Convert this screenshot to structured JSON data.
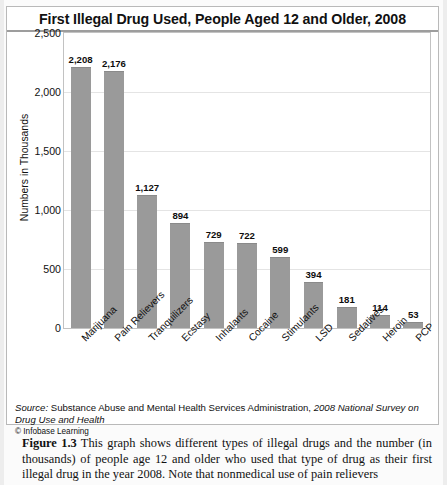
{
  "card": {
    "title": "First Illegal Drug Used, People Aged 12 and Older, 2008"
  },
  "source": {
    "prefix": "Source:",
    "text": " Substance Abuse and Mental Health Services Administration, ",
    "italic_title": "2008 National Survey on Drug Use and Health",
    "copyright": "© Infobase Learning"
  },
  "caption": {
    "figure_label": "Figure 1.3",
    "body": "   This graph shows different types of illegal drugs and the number (in thousands) of people age 12 and older who used that type of drug as their first illegal drug in the year 2008. Note that nonmedical use of pain relievers"
  },
  "chart_data": {
    "type": "bar",
    "title": "First Illegal Drug Used, People Aged 12 and Older, 2008",
    "xlabel": "",
    "ylabel": "Numbers in Thousands",
    "ylim": [
      0,
      2500
    ],
    "yticks": [
      0,
      500,
      1000,
      1500,
      2000,
      2500
    ],
    "ytick_labels": [
      "0",
      "500",
      "1,000",
      "1,500",
      "2,000",
      "2,500"
    ],
    "grid": true,
    "legend": false,
    "bar_color": "#9a9a9a",
    "categories": [
      "Marijuana",
      "Pain Relievers",
      "Tranquilizers",
      "Ecstasy",
      "Inhalants",
      "Cocaine",
      "Stimulants",
      "LSD",
      "Sedatives",
      "Heroin",
      "PCP"
    ],
    "values": [
      2208,
      2176,
      1127,
      894,
      729,
      722,
      599,
      394,
      181,
      114,
      53
    ],
    "value_labels": [
      "2,208",
      "2,176",
      "1,127",
      "894",
      "729",
      "722",
      "599",
      "394",
      "181",
      "114",
      "53"
    ]
  }
}
